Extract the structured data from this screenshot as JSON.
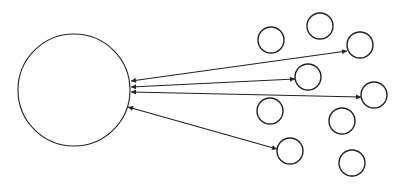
{
  "diagram": {
    "type": "hub-and-satellites",
    "stroke_color": "#222222",
    "background": "#ffffff",
    "hub": {
      "cx": 74,
      "cy": 90,
      "r": 56
    },
    "satellites": [
      {
        "id": "s1",
        "cx": 271,
        "cy": 40,
        "r": 13,
        "connected": false
      },
      {
        "id": "s2",
        "cx": 320,
        "cy": 26,
        "r": 13,
        "connected": false
      },
      {
        "id": "s3",
        "cx": 360,
        "cy": 45,
        "r": 13,
        "connected": true
      },
      {
        "id": "s4",
        "cx": 308,
        "cy": 77,
        "r": 13,
        "connected": true
      },
      {
        "id": "s5",
        "cx": 374,
        "cy": 95,
        "r": 13,
        "connected": true
      },
      {
        "id": "s6",
        "cx": 270,
        "cy": 111,
        "r": 13,
        "connected": false
      },
      {
        "id": "s7",
        "cx": 342,
        "cy": 121,
        "r": 13,
        "connected": false
      },
      {
        "id": "s8",
        "cx": 290,
        "cy": 151,
        "r": 13,
        "connected": true
      },
      {
        "id": "s9",
        "cx": 352,
        "cy": 163,
        "r": 13,
        "connected": false
      }
    ],
    "connections": [
      {
        "to": "s3",
        "x1": 131,
        "y1": 81,
        "x2": 347,
        "y2": 51,
        "bidirectional": true
      },
      {
        "to": "s4",
        "x1": 131,
        "y1": 87,
        "x2": 295,
        "y2": 79,
        "bidirectional": true
      },
      {
        "to": "s5",
        "x1": 131,
        "y1": 92,
        "x2": 361,
        "y2": 97,
        "bidirectional": true
      },
      {
        "to": "s8",
        "x1": 128,
        "y1": 107,
        "x2": 277,
        "y2": 149,
        "bidirectional": true
      }
    ]
  }
}
